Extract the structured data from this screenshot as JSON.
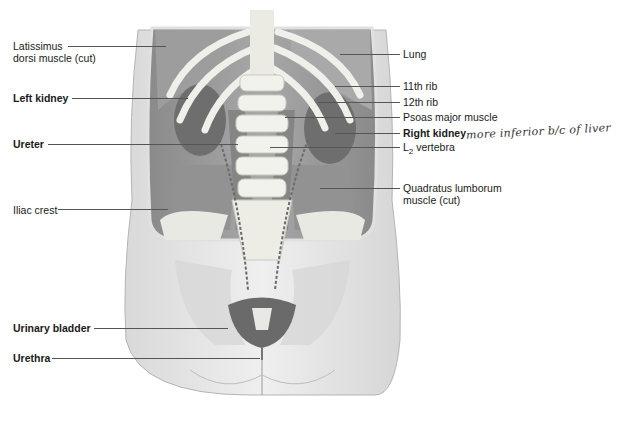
{
  "figure": {
    "colors": {
      "skin": "#e8e8e8",
      "bone": "#f2f2ee",
      "muscle": "#9a9a9a",
      "organ": "#6e6e6e",
      "line": "#555555"
    }
  },
  "labels_left": [
    {
      "text": "Latissimus",
      "text2": "dorsi muscle (cut)",
      "bold": false
    },
    {
      "text": "Left kidney",
      "bold": true
    },
    {
      "text": "Ureter",
      "bold": true
    },
    {
      "text": "Iliac crest",
      "bold": false
    },
    {
      "text": "Urinary bladder",
      "bold": true
    },
    {
      "text": "Urethra",
      "bold": true
    }
  ],
  "labels_right": [
    {
      "text": "Lung",
      "bold": false
    },
    {
      "text": "11th rib",
      "bold": false
    },
    {
      "text": "12th rib",
      "bold": false
    },
    {
      "text": "Psoas major muscle",
      "bold": false
    },
    {
      "text": "Right kidney",
      "bold": true
    },
    {
      "text": "L",
      "sub": "2",
      "rest": " vertebra",
      "bold": false
    },
    {
      "text": "Quadratus lumborum",
      "text2": "muscle (cut)",
      "bold": false
    }
  ],
  "handwritten_note": "more inferior b/c of liver"
}
